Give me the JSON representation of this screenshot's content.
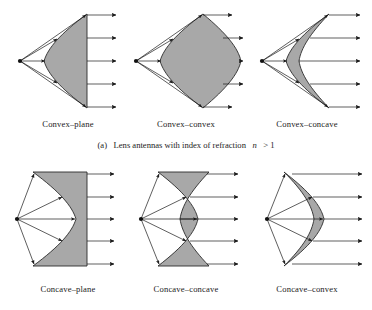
{
  "figure": {
    "background_color": "#ffffff",
    "ink_color": "#1a1a1a",
    "lens_fill_color": "#a8a8a8",
    "lens_stroke_color": "#2b2b2b"
  },
  "captions": {
    "part_a_prefix": "(a)",
    "part_a_text": "Lens antennas with index of refraction",
    "part_a_symbol": "n",
    "part_a_relation": "> 1"
  },
  "rows": [
    {
      "id": "row-a",
      "index_of_refraction": "n > 1",
      "lenses": [
        {
          "id": "convex-plane",
          "label": "Convex–plane",
          "left_surface": "convex",
          "right_surface": "plane",
          "ray_count": 5
        },
        {
          "id": "convex-convex",
          "label": "Convex–convex",
          "left_surface": "convex",
          "right_surface": "convex",
          "ray_count": 5
        },
        {
          "id": "convex-concave",
          "label": "Convex–concave",
          "left_surface": "convex",
          "right_surface": "concave",
          "ray_count": 5
        }
      ]
    },
    {
      "id": "row-b",
      "lenses": [
        {
          "id": "concave-plane",
          "label": "Concave–plane",
          "left_surface": "concave",
          "right_surface": "plane",
          "ray_count": 5
        },
        {
          "id": "concave-concave",
          "label": "Concave–concave",
          "left_surface": "concave",
          "right_surface": "concave",
          "ray_count": 5
        },
        {
          "id": "concave-convex",
          "label": "Concave–convex",
          "left_surface": "concave",
          "right_surface": "convex",
          "ray_count": 5
        }
      ]
    }
  ],
  "labels": {
    "r0c0": "Convex–plane",
    "r0c1": "Convex–convex",
    "r0c2": "Convex–concave",
    "r1c0": "Concave–plane",
    "r1c1": "Concave–concave",
    "r1c2": "Concave–convex"
  }
}
